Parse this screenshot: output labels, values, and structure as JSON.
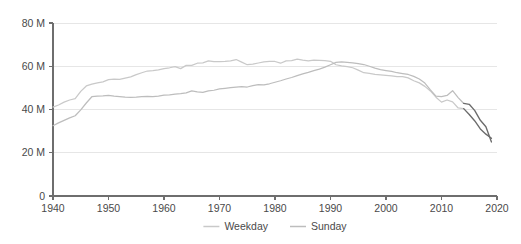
{
  "chart_data": {
    "type": "line",
    "title": "",
    "subtitle": "",
    "xlabel": "",
    "ylabel": "",
    "xlim": [
      1940,
      2020
    ],
    "ylim": [
      0,
      80
    ],
    "grid": true,
    "legend_position": "bottom-center",
    "x_ticks": [
      1940,
      1950,
      1960,
      1970,
      1980,
      1990,
      2000,
      2010,
      2020
    ],
    "x_tick_labels": [
      "1940",
      "1950",
      "1960",
      "1970",
      "1980",
      "1990",
      "2000",
      "2010",
      "2020"
    ],
    "y_ticks": [
      0,
      20,
      40,
      60,
      80
    ],
    "y_tick_labels": [
      "0",
      "20 M",
      "40 M",
      "60 M",
      "80 M"
    ],
    "y_unit": "M",
    "colors": {
      "weekday": "#c9c9c9",
      "sunday": "#bdbdbd",
      "estimate": "#6b6b6b",
      "gridline": "#e6e6e6",
      "axis": "#6e6e6e",
      "text": "#4a4a4a",
      "background": "#ffffff"
    },
    "series": [
      {
        "name": "Weekday",
        "color": "#c9c9c9",
        "x": [
          1940,
          1941,
          1942,
          1943,
          1944,
          1945,
          1946,
          1947,
          1948,
          1949,
          1950,
          1951,
          1952,
          1953,
          1954,
          1955,
          1956,
          1957,
          1958,
          1959,
          1960,
          1961,
          1962,
          1963,
          1964,
          1965,
          1966,
          1967,
          1968,
          1969,
          1970,
          1971,
          1972,
          1973,
          1974,
          1975,
          1976,
          1977,
          1978,
          1979,
          1980,
          1981,
          1982,
          1983,
          1984,
          1985,
          1986,
          1987,
          1988,
          1989,
          1990,
          1991,
          1992,
          1993,
          1994,
          1995,
          1996,
          1997,
          1998,
          1999,
          2000,
          2001,
          2002,
          2003,
          2004,
          2005,
          2006,
          2007,
          2008,
          2009,
          2010,
          2011,
          2012,
          2013,
          2014,
          2015,
          2016,
          2017,
          2018,
          2019
        ],
        "values": [
          41.1,
          42.1,
          43.4,
          44.4,
          45.0,
          48.4,
          50.9,
          51.7,
          52.3,
          52.8,
          53.8,
          54.0,
          53.9,
          54.5,
          55.1,
          56.1,
          57.0,
          57.8,
          58.0,
          58.3,
          58.9,
          59.3,
          59.8,
          58.9,
          60.4,
          60.4,
          61.4,
          61.6,
          62.5,
          62.1,
          62.1,
          62.2,
          62.5,
          63.1,
          61.9,
          60.7,
          61.0,
          61.5,
          62.0,
          62.2,
          62.2,
          61.4,
          62.5,
          62.6,
          63.3,
          62.8,
          62.5,
          62.8,
          62.7,
          62.6,
          62.3,
          60.7,
          60.2,
          59.8,
          59.3,
          58.2,
          57.0,
          56.7,
          56.2,
          56.0,
          55.8,
          55.6,
          55.2,
          55.2,
          54.6,
          53.3,
          52.3,
          50.7,
          48.6,
          45.7,
          43.4,
          44.4,
          43.5,
          40.7,
          40.4,
          37.7,
          34.7,
          31.0,
          28.6,
          26.7
        ]
      },
      {
        "name": "Sunday",
        "color": "#bdbdbd",
        "x": [
          1940,
          1941,
          1942,
          1943,
          1944,
          1945,
          1946,
          1947,
          1948,
          1949,
          1950,
          1951,
          1952,
          1953,
          1954,
          1955,
          1956,
          1957,
          1958,
          1959,
          1960,
          1961,
          1962,
          1963,
          1964,
          1965,
          1966,
          1967,
          1968,
          1969,
          1970,
          1971,
          1972,
          1973,
          1974,
          1975,
          1976,
          1977,
          1978,
          1979,
          1980,
          1981,
          1982,
          1983,
          1984,
          1985,
          1986,
          1987,
          1988,
          1989,
          1990,
          1991,
          1992,
          1993,
          1994,
          1995,
          1996,
          1997,
          1998,
          1999,
          2000,
          2001,
          2002,
          2003,
          2004,
          2005,
          2006,
          2007,
          2008,
          2009,
          2010,
          2011,
          2012,
          2013,
          2014,
          2015,
          2016,
          2017,
          2018,
          2019
        ],
        "values": [
          32.5,
          33.8,
          35.0,
          36.1,
          37.1,
          39.8,
          43.0,
          45.9,
          46.2,
          46.3,
          46.5,
          46.2,
          46.0,
          45.7,
          45.6,
          45.7,
          46.0,
          46.1,
          46.0,
          46.2,
          46.6,
          46.8,
          47.1,
          47.3,
          47.7,
          48.6,
          48.2,
          47.9,
          48.6,
          48.9,
          49.5,
          49.8,
          50.1,
          50.4,
          50.6,
          50.4,
          51.0,
          51.5,
          51.4,
          51.9,
          52.6,
          53.3,
          54.1,
          54.8,
          55.7,
          56.5,
          57.2,
          58.0,
          58.7,
          59.6,
          60.7,
          61.8,
          62.0,
          61.8,
          61.6,
          61.2,
          60.8,
          60.0,
          59.1,
          58.4,
          58.0,
          57.6,
          57.0,
          56.6,
          56.2,
          55.3,
          54.1,
          52.2,
          49.1,
          46.2,
          46.0,
          46.5,
          48.7,
          45.5,
          42.8,
          42.4,
          39.5,
          35.0,
          32.0,
          25.0
        ]
      }
    ],
    "estimated_segment": {
      "note": "final years shown in darker stroke",
      "start_year": 2014,
      "end_year": 2019
    }
  },
  "legend": {
    "items": [
      {
        "label": "Weekday",
        "color": "#c9c9c9"
      },
      {
        "label": "Sunday",
        "color": "#bdbdbd"
      }
    ]
  }
}
